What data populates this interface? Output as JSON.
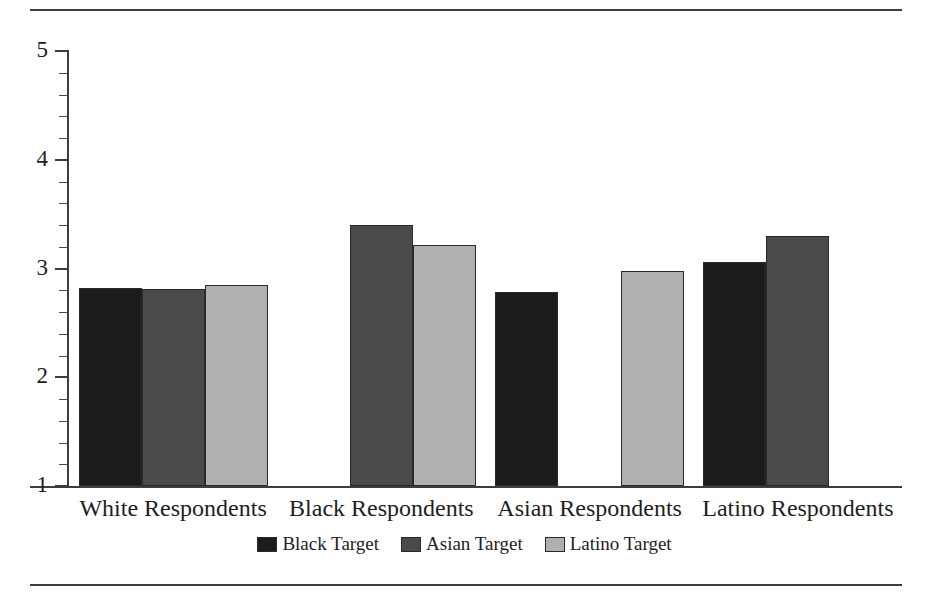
{
  "chart_data": {
    "type": "bar",
    "title": "",
    "subtitle": "",
    "xlabel": "",
    "ylabel": "",
    "ylim": [
      1,
      5
    ],
    "y_major_ticks": [
      "1",
      "2",
      "3",
      "4",
      "5"
    ],
    "y_minor_tick_step": 0.2,
    "grid": false,
    "legend_position": "bottom-center",
    "categories": [
      "White Respondents",
      "Black Respondents",
      "Asian Respondents",
      "Latino Respondents"
    ],
    "series": [
      {
        "name": "Black Target",
        "color": "#1c1c1c",
        "values": [
          2.82,
          null,
          2.78,
          3.06
        ]
      },
      {
        "name": "Asian Target",
        "color": "#4a4a4a",
        "values": [
          2.81,
          3.4,
          null,
          3.3
        ]
      },
      {
        "name": "Latino Target",
        "color": "#b0b0b0",
        "values": [
          2.85,
          3.22,
          2.98,
          null
        ]
      }
    ]
  },
  "axis": {
    "y_ticks": [
      {
        "value": "5"
      },
      {
        "value": "4"
      },
      {
        "value": "3"
      },
      {
        "value": "2"
      },
      {
        "value": "1"
      }
    ]
  },
  "legend": {
    "items": [
      {
        "label": "Black Target",
        "color": "#1c1c1c"
      },
      {
        "label": "Asian Target",
        "color": "#4a4a4a"
      },
      {
        "label": "Latino Target",
        "color": "#b0b0b0"
      }
    ]
  },
  "colors": {
    "black_target": "#1c1c1c",
    "asian_target": "#4a4a4a",
    "latino_target": "#b0b0b0",
    "axis": "#3d3d3d",
    "text": "#1e1e1e",
    "background": "#ffffff"
  }
}
